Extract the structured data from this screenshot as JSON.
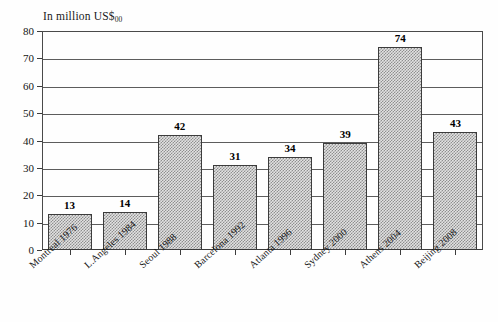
{
  "chart_data": {
    "type": "bar",
    "title": "In million US$",
    "title_subscript": "00",
    "xlabel": "",
    "ylabel": "",
    "ylim": [
      0,
      80
    ],
    "ytick_step": 10,
    "yticks": [
      "0",
      "10",
      "20",
      "30",
      "40",
      "50",
      "60",
      "70",
      "80"
    ],
    "grid": true,
    "legend": "none",
    "categories": [
      "Montreal 1976",
      "L.Angeles 1984",
      "Seoul 1988",
      "Barcelona 1992",
      "Atlanta 1996",
      "Sydney 2000",
      "Athens 2004",
      "Beijing 2008"
    ],
    "values": [
      13,
      14,
      42,
      31,
      34,
      39,
      74,
      43
    ],
    "value_labels": [
      "13",
      "14",
      "42",
      "31",
      "34",
      "39",
      "74",
      "43"
    ],
    "bar_fill": "#e2e2e2",
    "bar_pattern": "fine-checker-stipple",
    "bar_edge_color": "#3c3c3c",
    "axis_color": "#4a4a4a",
    "grid_color": "#5d5d5d",
    "background": "#ffffff"
  }
}
